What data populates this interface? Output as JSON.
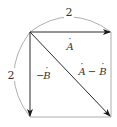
{
  "diagram": {
    "title": "",
    "colors": {
      "stroke": "#2a2a2a",
      "arc": "#888888",
      "frame": "#999999",
      "text": "#333333"
    },
    "nodes": [
      {
        "id": "origin",
        "x": 30,
        "y": 32
      },
      {
        "id": "top_right",
        "x": 111,
        "y": 32
      },
      {
        "id": "bottom_left",
        "x": 30,
        "y": 117
      },
      {
        "id": "bottom_right",
        "x": 111,
        "y": 117
      }
    ],
    "vectors": [
      {
        "id": "A",
        "from": "origin",
        "to": "top_right",
        "label": "A",
        "label_dot": true
      },
      {
        "id": "negB",
        "from": "origin",
        "to": "bottom_left",
        "label_prefix": "−",
        "label": "B",
        "label_dot": true
      },
      {
        "id": "AminusB",
        "from": "origin",
        "to": "bottom_right",
        "label_left": "A",
        "label_op": " − ",
        "label_right": "B",
        "label_dot": true
      }
    ],
    "dimensions": [
      {
        "id": "top_width",
        "value": "2",
        "along": "top"
      },
      {
        "id": "left_height",
        "value": "2",
        "along": "left"
      }
    ],
    "labels": {
      "top_dim": "2",
      "left_dim": "2",
      "vec_a": "A",
      "vec_negb_sign": "−",
      "vec_negb": "B",
      "vec_diff_a": "A",
      "vec_diff_op": "−",
      "vec_diff_b": "B",
      "dot": "·"
    }
  }
}
